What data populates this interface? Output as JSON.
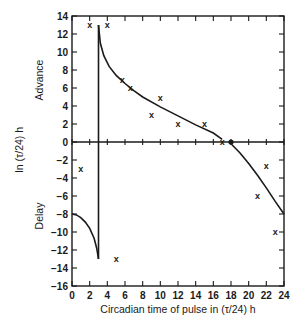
{
  "chart_data": {
    "type": "scatter",
    "title": "",
    "xlabel": "Circadian time of pulse in (τ/24) h",
    "ylabel": "In (τ/24) h",
    "ylabel_upper": "Advance",
    "ylabel_lower": "Delay",
    "xlim": [
      0,
      24
    ],
    "ylim": [
      -16,
      14
    ],
    "x_ticks": [
      0,
      2,
      4,
      6,
      8,
      10,
      12,
      14,
      16,
      18,
      20,
      22,
      24
    ],
    "y_ticks": [
      14,
      12,
      10,
      8,
      6,
      4,
      2,
      0,
      -2,
      -4,
      -6,
      -8,
      -10,
      -12,
      -14,
      -16
    ],
    "grid": false,
    "series": [
      {
        "name": "observed phase shifts",
        "marker": "x",
        "points": [
          {
            "x": 2,
            "y": 13
          },
          {
            "x": 4,
            "y": 13
          },
          {
            "x": 5.7,
            "y": 6.9
          },
          {
            "x": 6.6,
            "y": 6
          },
          {
            "x": 9,
            "y": 3
          },
          {
            "x": 10,
            "y": 4.9
          },
          {
            "x": 12,
            "y": 2
          },
          {
            "x": 15,
            "y": 2
          },
          {
            "x": 17,
            "y": 0
          },
          {
            "x": 1,
            "y": -3
          },
          {
            "x": 5,
            "y": -13
          },
          {
            "x": 21,
            "y": -6
          },
          {
            "x": 22,
            "y": -2.7
          },
          {
            "x": 23,
            "y": -10
          }
        ]
      },
      {
        "name": "zero point",
        "marker": "dot",
        "points": [
          {
            "x": 18,
            "y": 0
          }
        ]
      },
      {
        "name": "delay curve early",
        "type": "line",
        "points": [
          {
            "x": 0,
            "y": -8
          },
          {
            "x": 0.5,
            "y": -8.1
          },
          {
            "x": 1,
            "y": -8.4
          },
          {
            "x": 1.5,
            "y": -8.9
          },
          {
            "x": 2,
            "y": -9.6
          },
          {
            "x": 2.5,
            "y": -10.7
          },
          {
            "x": 2.8,
            "y": -11.8
          },
          {
            "x": 3,
            "y": -13
          }
        ]
      },
      {
        "name": "breakpoint",
        "type": "line",
        "points": [
          {
            "x": 3,
            "y": -13
          },
          {
            "x": 3,
            "y": 13
          }
        ]
      },
      {
        "name": "advance curve",
        "type": "line",
        "points": [
          {
            "x": 3,
            "y": 13
          },
          {
            "x": 3.2,
            "y": 11
          },
          {
            "x": 3.6,
            "y": 9.6
          },
          {
            "x": 4.2,
            "y": 8.4
          },
          {
            "x": 5,
            "y": 7.4
          },
          {
            "x": 6,
            "y": 6.5
          },
          {
            "x": 7,
            "y": 5.7
          },
          {
            "x": 8,
            "y": 5
          },
          {
            "x": 10,
            "y": 3.9
          },
          {
            "x": 12,
            "y": 2.9
          },
          {
            "x": 14,
            "y": 1.9
          },
          {
            "x": 16,
            "y": 1
          },
          {
            "x": 17,
            "y": 0.3
          }
        ]
      },
      {
        "name": "delay curve late",
        "type": "line",
        "points": [
          {
            "x": 18,
            "y": -0.2
          },
          {
            "x": 19,
            "y": -1.2
          },
          {
            "x": 20,
            "y": -2.4
          },
          {
            "x": 21,
            "y": -3.7
          },
          {
            "x": 22,
            "y": -5.1
          },
          {
            "x": 23,
            "y": -6.6
          },
          {
            "x": 24,
            "y": -8
          }
        ]
      }
    ]
  }
}
